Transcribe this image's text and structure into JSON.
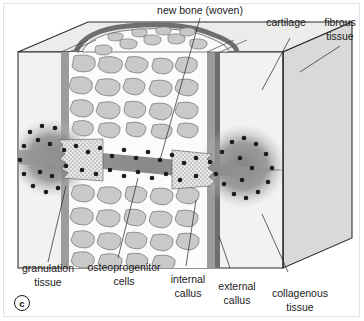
{
  "figure": {
    "panel_letter": "c",
    "caption_subject": "bone fracture healing — woven bone and callus formation",
    "diagram_type": "3d-cutaway-block"
  },
  "labels": {
    "new_bone": "new bone (woven)",
    "cartilage": "cartilage",
    "fibrous_tissue_line1": "fibrous",
    "fibrous_tissue_line2": "tissue",
    "granulation_line1": "granulation",
    "granulation_line2": "tissue",
    "osteoprogenitor_line1": "osteoprogenitor",
    "osteoprogenitor_line2": "cells",
    "internal_callus_line1": "internal",
    "internal_callus_line2": "callus",
    "external_callus_line1": "external",
    "external_callus_line2": "callus",
    "collagenous_line1": "collagenous",
    "collagenous_line2": "tissue"
  },
  "colors": {
    "background": "#ffffff",
    "block_face_light": "#f2f2f0",
    "block_face_mid": "#e2e2e0",
    "block_face_dark": "#d4d4d2",
    "top_face": "#ececea",
    "trabecula_fill": "#c9c9c7",
    "cortical_strip": "#9c9c9a",
    "cortical_dark": "#6f6f6d",
    "granulation_halo": "#8e8e8c",
    "cell_dot": "#1c1c1c",
    "outline": "#2b2b2b",
    "text": "#1a1a1a",
    "frame_border": "#e3e3e3"
  },
  "structures": [
    {
      "name": "new bone (woven)",
      "region": "central fracture line, stippled zigzag band"
    },
    {
      "name": "cartilage",
      "region": "top surface outer rim"
    },
    {
      "name": "fibrous tissue",
      "region": "right outer block face"
    },
    {
      "name": "granulation tissue",
      "region": "left dark halo around fracture"
    },
    {
      "name": "osteoprogenitor cells",
      "region": "dark dots lining fracture band"
    },
    {
      "name": "internal callus",
      "region": "trabecular marrow cavity at fracture"
    },
    {
      "name": "external callus",
      "region": "dark cortical strip right of midline"
    },
    {
      "name": "collagenous tissue",
      "region": "right block face near lower edge"
    }
  ]
}
